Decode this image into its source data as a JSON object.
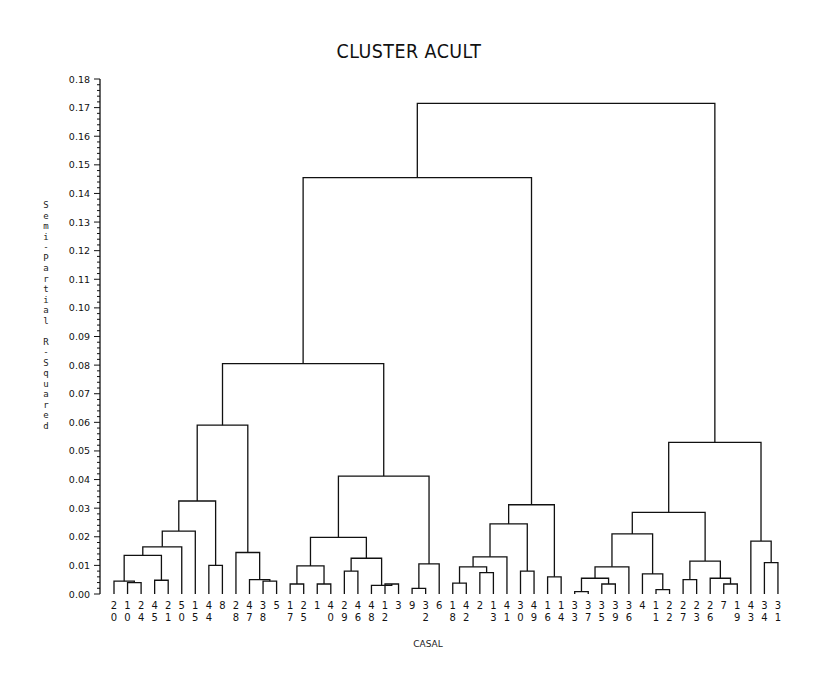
{
  "chart_data": {
    "type": "dendrogram",
    "title": "CLUSTER ACULT",
    "xlabel": "CASAL",
    "ylabel": "Semi-Partial R-Squared",
    "ylim": [
      0.0,
      0.18
    ],
    "yticks": [
      "0.00",
      "0.01",
      "0.02",
      "0.03",
      "0.04",
      "0.05",
      "0.06",
      "0.07",
      "0.08",
      "0.09",
      "0.10",
      "0.11",
      "0.12",
      "0.13",
      "0.14",
      "0.15",
      "0.16",
      "0.17",
      "0.18"
    ],
    "leaves": [
      "20",
      "10",
      "24",
      "45",
      "21",
      "50",
      "15",
      "44",
      "8",
      "28",
      "47",
      "38",
      "5",
      "17",
      "25",
      "1",
      "40",
      "29",
      "46",
      "48",
      "12",
      "3",
      "9",
      "32",
      "6",
      "18",
      "42",
      "2",
      "13",
      "41",
      "30",
      "49",
      "16",
      "14",
      "33",
      "37",
      "35",
      "39",
      "36",
      "4",
      "11",
      "22",
      "27",
      "23",
      "26",
      "7",
      "19",
      "43",
      "34",
      "31"
    ],
    "merges": [
      {
        "id": "a1",
        "children": [
          "L1",
          "L2"
        ],
        "height": 0.004
      },
      {
        "id": "a2",
        "children": [
          "L0",
          "a1"
        ],
        "height": 0.0045
      },
      {
        "id": "a3",
        "children": [
          "L3",
          "L4"
        ],
        "height": 0.0048
      },
      {
        "id": "a4",
        "children": [
          "a2",
          "a3"
        ],
        "height": 0.0135
      },
      {
        "id": "a5",
        "children": [
          "a4",
          "L5"
        ],
        "height": 0.0165
      },
      {
        "id": "a6",
        "children": [
          "a5",
          "L6"
        ],
        "height": 0.022
      },
      {
        "id": "a7",
        "children": [
          "L7",
          "L8"
        ],
        "height": 0.01
      },
      {
        "id": "a8",
        "children": [
          "a6",
          "a7"
        ],
        "height": 0.0325
      },
      {
        "id": "b1",
        "children": [
          "L11",
          "L12"
        ],
        "height": 0.0045
      },
      {
        "id": "b2",
        "children": [
          "L10",
          "b1"
        ],
        "height": 0.005
      },
      {
        "id": "b3",
        "children": [
          "L9",
          "b2"
        ],
        "height": 0.0145
      },
      {
        "id": "a9",
        "children": [
          "a8",
          "b3"
        ],
        "height": 0.059
      },
      {
        "id": "c1",
        "children": [
          "L13",
          "L14"
        ],
        "height": 0.0035
      },
      {
        "id": "c2",
        "children": [
          "L15",
          "L16"
        ],
        "height": 0.0035
      },
      {
        "id": "c3",
        "children": [
          "c1",
          "c2"
        ],
        "height": 0.0098
      },
      {
        "id": "c4",
        "children": [
          "L17",
          "L18"
        ],
        "height": 0.008
      },
      {
        "id": "c5",
        "children": [
          "L20",
          "L21"
        ],
        "height": 0.0035
      },
      {
        "id": "c6",
        "children": [
          "L19",
          "c5"
        ],
        "height": 0.003
      },
      {
        "id": "c7",
        "children": [
          "c4",
          "c6"
        ],
        "height": 0.0125
      },
      {
        "id": "c8",
        "children": [
          "c3",
          "c7"
        ],
        "height": 0.0198
      },
      {
        "id": "c9",
        "children": [
          "L22",
          "L23"
        ],
        "height": 0.002
      },
      {
        "id": "c10",
        "children": [
          "c9",
          "L24"
        ],
        "height": 0.0105
      },
      {
        "id": "c11",
        "children": [
          "c8",
          "c10"
        ],
        "height": 0.0412
      },
      {
        "id": "m1",
        "children": [
          "a9",
          "c11"
        ],
        "height": 0.0805
      },
      {
        "id": "d1",
        "children": [
          "L25",
          "L26"
        ],
        "height": 0.0038
      },
      {
        "id": "d2",
        "children": [
          "L27",
          "L28"
        ],
        "height": 0.0075
      },
      {
        "id": "d2b",
        "children": [
          "d1",
          "d2"
        ],
        "height": 0.0095
      },
      {
        "id": "d3",
        "children": [
          "d2b",
          "L29"
        ],
        "height": 0.013
      },
      {
        "id": "d4",
        "children": [
          "L30",
          "L31"
        ],
        "height": 0.008
      },
      {
        "id": "d5",
        "children": [
          "d3",
          "d4"
        ],
        "height": 0.0245
      },
      {
        "id": "d6",
        "children": [
          "L32",
          "L33"
        ],
        "height": 0.006
      },
      {
        "id": "d7",
        "children": [
          "d5",
          "d6"
        ],
        "height": 0.0312
      },
      {
        "id": "m2",
        "children": [
          "m1",
          "d7"
        ],
        "height": 0.1455
      },
      {
        "id": "e1",
        "children": [
          "L34",
          "L35"
        ],
        "height": 0.0008
      },
      {
        "id": "e2",
        "children": [
          "L36",
          "L37"
        ],
        "height": 0.0035
      },
      {
        "id": "e3",
        "children": [
          "e1",
          "e2"
        ],
        "height": 0.0055
      },
      {
        "id": "e4",
        "children": [
          "e3",
          "L38"
        ],
        "height": 0.0095
      },
      {
        "id": "e5",
        "children": [
          "L40",
          "L41"
        ],
        "height": 0.0015
      },
      {
        "id": "e6",
        "children": [
          "L39",
          "e5"
        ],
        "height": 0.007
      },
      {
        "id": "e7",
        "children": [
          "e4",
          "e6"
        ],
        "height": 0.021
      },
      {
        "id": "f1",
        "children": [
          "L42",
          "L43"
        ],
        "height": 0.005
      },
      {
        "id": "f2",
        "children": [
          "L45",
          "L46"
        ],
        "height": 0.0035
      },
      {
        "id": "f3",
        "children": [
          "L44",
          "f2"
        ],
        "height": 0.0055
      },
      {
        "id": "f4",
        "children": [
          "f1",
          "f3"
        ],
        "height": 0.0115
      },
      {
        "id": "f5",
        "children": [
          "e7",
          "f4"
        ],
        "height": 0.0285
      },
      {
        "id": "g1",
        "children": [
          "L48",
          "L49"
        ],
        "height": 0.011
      },
      {
        "id": "g2",
        "children": [
          "L47",
          "g1"
        ],
        "height": 0.0185
      },
      {
        "id": "g3",
        "children": [
          "f5",
          "g2"
        ],
        "height": 0.053
      },
      {
        "id": "root",
        "children": [
          "m2",
          "g3"
        ],
        "height": 0.1715
      }
    ]
  }
}
